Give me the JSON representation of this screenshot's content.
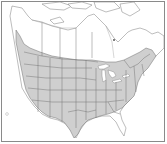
{
  "map": {
    "type": "species-distribution-range-map",
    "region": "North America (Canada, United States, northern Mexico)",
    "colors": {
      "background": "#ffffff",
      "range_fill": "#cfcfcf",
      "boundary_lines": "#6e6e6e",
      "frame": "#8a8a8a"
    },
    "shaded_range": {
      "description": "Gray shading covering nearly all of the contiguous United States and southern Canada (southern British Columbia through southern Quebec and the Maritimes), excluding coastal California and peninsular Florida",
      "includes": [
        "Contiguous United States (most)",
        "Southern Canada",
        "Pacific Northwest coast"
      ],
      "excludes": [
        "Northern Canada",
        "Alaska",
        "Mexico",
        "Florida peninsula",
        "Southern California coast"
      ]
    },
    "labels": []
  }
}
